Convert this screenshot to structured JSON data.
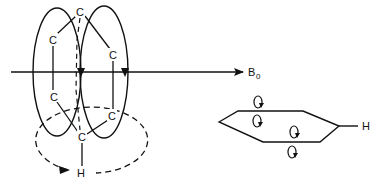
{
  "diagram": {
    "title": "",
    "field_label": "B",
    "field_subscript": "0",
    "left_molecule": {
      "atoms": [
        {
          "id": "c_top",
          "label": "C",
          "x": 80,
          "y": 12
        },
        {
          "id": "c_upper_left",
          "label": "C",
          "x": 53,
          "y": 40
        },
        {
          "id": "c_upper_right",
          "label": "C",
          "x": 113,
          "y": 55
        },
        {
          "id": "c_lower_left",
          "label": "C",
          "x": 54,
          "y": 97
        },
        {
          "id": "c_lower_right",
          "label": "C",
          "x": 112,
          "y": 116
        },
        {
          "id": "c_bottom",
          "label": "C",
          "x": 82,
          "y": 137
        },
        {
          "id": "h",
          "label": "H",
          "x": 81,
          "y": 172
        }
      ],
      "ring_current_loops": 2,
      "induced_field_loop": "dashed"
    },
    "right_molecule": {
      "shape": "hexagon-edge-view",
      "substituent_label": "H",
      "circulation_markers": 4
    }
  },
  "colors": {
    "ink": "#111111",
    "background": "#ffffff"
  }
}
